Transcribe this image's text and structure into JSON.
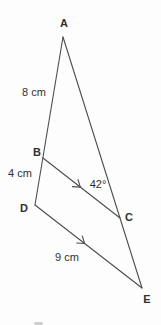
{
  "diagram": {
    "colors": {
      "background": "#fdfdfd",
      "line": "#4d4d4d",
      "text": "#303030"
    },
    "line_width": 1.1,
    "font_size": 11,
    "points": {
      "A": {
        "x": 63,
        "y": 37
      },
      "B": {
        "x": 43,
        "y": 158
      },
      "C": {
        "x": 120,
        "y": 218
      },
      "D": {
        "x": 35,
        "y": 205
      },
      "E": {
        "x": 142,
        "y": 288
      }
    },
    "segments": [
      {
        "from": "A",
        "to": "D",
        "arrow_at": null
      },
      {
        "from": "A",
        "to": "E",
        "arrow_at": null
      },
      {
        "from": "B",
        "to": "C",
        "arrow_at": 0.48
      },
      {
        "from": "D",
        "to": "E",
        "arrow_at": 0.46
      }
    ],
    "vertex_labels": [
      {
        "text": "A",
        "x": 64,
        "y": 27
      },
      {
        "text": "B",
        "x": 37,
        "y": 156
      },
      {
        "text": "C",
        "x": 129,
        "y": 221
      },
      {
        "text": "D",
        "x": 24,
        "y": 212
      },
      {
        "text": "E",
        "x": 147,
        "y": 303
      }
    ],
    "measurement_labels": [
      {
        "text": "8 cm",
        "x": 34,
        "y": 96
      },
      {
        "text": "4 cm",
        "x": 20,
        "y": 177
      },
      {
        "text": "9 cm",
        "x": 67,
        "y": 261
      }
    ],
    "angle_labels": [
      {
        "text": "42°",
        "x": 98,
        "y": 188
      }
    ],
    "artifact": {
      "x": 34,
      "y": 322,
      "w": 9,
      "h": 3
    }
  }
}
